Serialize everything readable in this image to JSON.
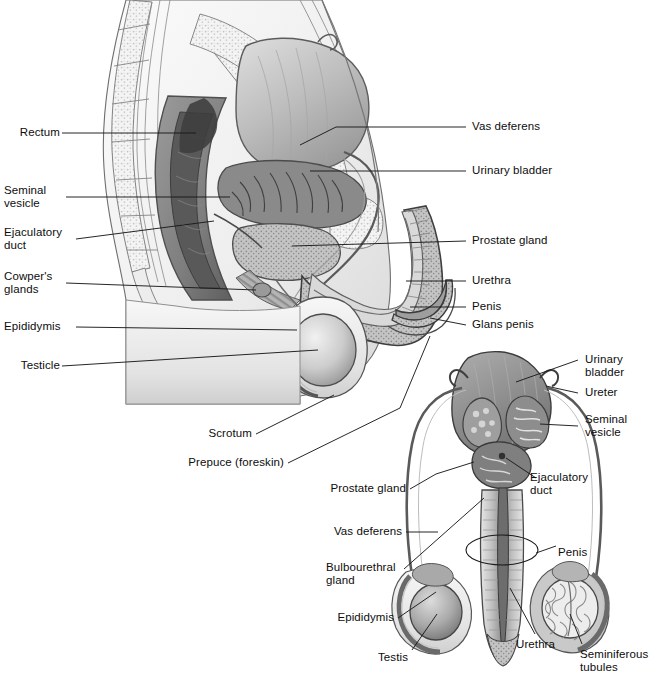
{
  "figure": {
    "panels": [
      {
        "id": "sagittal",
        "name": "Midsagittal section of the male pelvis",
        "labels": [
          {
            "key": "rectum",
            "text": "Rectum",
            "side": "left"
          },
          {
            "key": "seminal_vesicle",
            "text": "Seminal\nvesicle",
            "side": "left"
          },
          {
            "key": "ejaculatory_duct",
            "text": "Ejaculatory\nduct",
            "side": "left"
          },
          {
            "key": "cowpers_glands",
            "text": "Cowper's\nglands",
            "side": "left"
          },
          {
            "key": "epididymis",
            "text": "Epididymis",
            "side": "left"
          },
          {
            "key": "testicle",
            "text": "Testicle",
            "side": "left"
          },
          {
            "key": "scrotum",
            "text": "Scrotum",
            "side": "left"
          },
          {
            "key": "prepuce",
            "text": "Prepuce (foreskin)",
            "side": "left"
          },
          {
            "key": "vas_deferens",
            "text": "Vas deferens",
            "side": "right"
          },
          {
            "key": "urinary_bladder",
            "text": "Urinary bladder",
            "side": "right"
          },
          {
            "key": "prostate_gland",
            "text": "Prostate gland",
            "side": "right"
          },
          {
            "key": "urethra",
            "text": "Urethra",
            "side": "right"
          },
          {
            "key": "penis",
            "text": "Penis",
            "side": "right"
          },
          {
            "key": "glans_penis",
            "text": "Glans penis",
            "side": "right"
          }
        ]
      },
      {
        "id": "anterior",
        "name": "Anterior (posterior) view of the male reproductive organs",
        "labels": [
          {
            "key": "urinary_bladder",
            "text": "Urinary bladder",
            "side": "right"
          },
          {
            "key": "ureter",
            "text": "Ureter",
            "side": "right"
          },
          {
            "key": "seminal_vesicle",
            "text": "Seminal\nvesicle",
            "side": "right"
          },
          {
            "key": "ejaculatory_duct",
            "text": "Ejaculatory\nduct",
            "side": "right"
          },
          {
            "key": "penis",
            "text": "Penis",
            "side": "right"
          },
          {
            "key": "urethra",
            "text": "Urethra",
            "side": "right"
          },
          {
            "key": "seminiferous_tubules",
            "text": "Seminiferous\ntubules",
            "side": "right"
          },
          {
            "key": "prostate_gland",
            "text": "Prostate gland",
            "side": "left"
          },
          {
            "key": "vas_deferens",
            "text": "Vas deferens",
            "side": "left"
          },
          {
            "key": "bulbourethral_gland",
            "text": "Bulbourethral\ngland",
            "side": "left"
          },
          {
            "key": "epididymis",
            "text": "Epididymis",
            "side": "left"
          },
          {
            "key": "testis",
            "text": "Testis",
            "side": "left"
          }
        ]
      }
    ]
  },
  "colors": {
    "background": "#ffffff",
    "line": "#1a1a1a",
    "text": "#0d0d0d",
    "tissue_light": "#efefef",
    "tissue_mid": "#c9c9c9",
    "tissue_dark": "#8f8f8f",
    "organ_dark": "#6e6e6e",
    "organ_darkest": "#4a4a4a",
    "bone": "#f2f2f2"
  }
}
